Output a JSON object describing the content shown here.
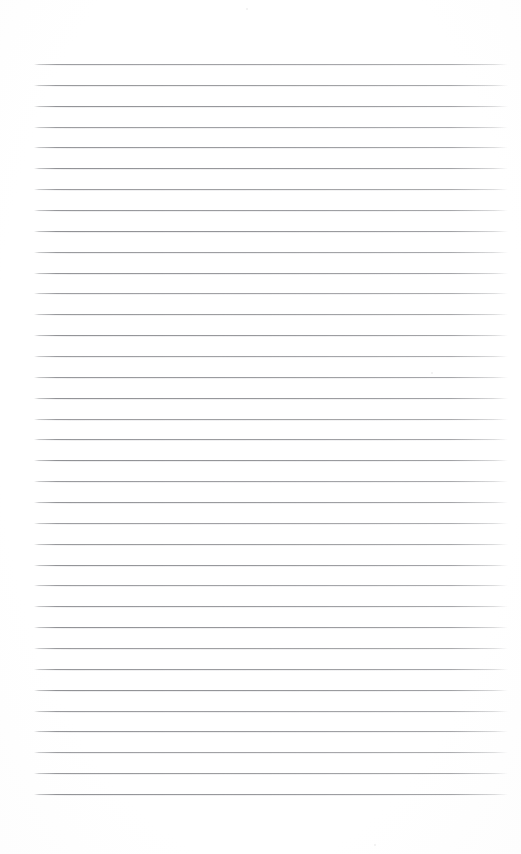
{
  "document": {
    "kind": "scanned-blank-ruled-page",
    "title": "Blank Ruled Notebook Page",
    "background_color": "#ffffff",
    "page_width": 521,
    "page_height": 854,
    "visible_text": "",
    "has_handwriting": false,
    "has_printed_text": false
  },
  "ruling": {
    "line_color": "#8d8e92",
    "line_thickness_px": 1,
    "line_count": 36,
    "left_margin_px": 34,
    "right_edge_px": 508,
    "line_length_px": 474,
    "first_line_y_px": 64,
    "last_line_y_px": 794,
    "line_spacing_px": 20.86,
    "top_blank_margin_px": 64,
    "bottom_blank_margin_px": 60,
    "has_vertical_margin_rule": false,
    "lines_y": [
      64,
      84.9,
      105.7,
      126.6,
      147.4,
      168.3,
      189.1,
      210,
      230.9,
      251.7,
      272.6,
      293.4,
      314.3,
      335.1,
      356,
      376.9,
      397.7,
      418.6,
      439.4,
      460.3,
      481.1,
      502,
      522.9,
      543.7,
      564.6,
      585.4,
      606.3,
      627.1,
      648,
      668.9,
      689.7,
      710.6,
      731.4,
      752.3,
      773.1,
      794
    ]
  },
  "artifacts": {
    "specks": [
      {
        "x": 431,
        "y": 372,
        "size": 2
      },
      {
        "x": 246,
        "y": 8,
        "size": 2
      },
      {
        "x": 374,
        "y": 844,
        "size": 2
      }
    ]
  }
}
